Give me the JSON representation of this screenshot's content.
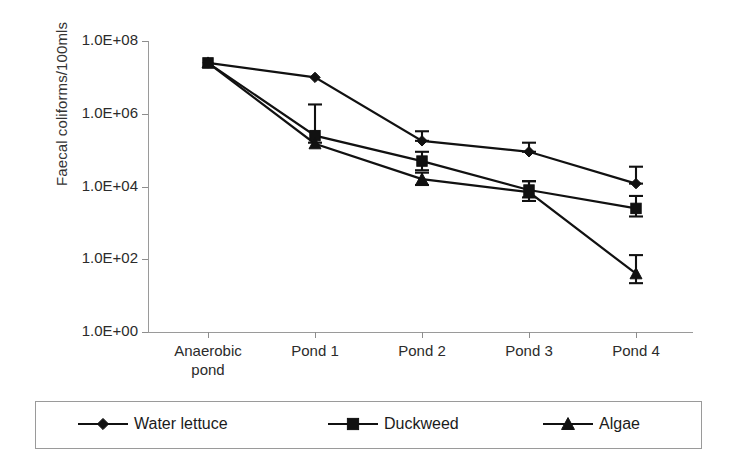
{
  "chart_data": {
    "type": "line",
    "title": "",
    "xlabel": "",
    "ylabel": "Faecal coliforms/100mls",
    "scale": "log",
    "grid": false,
    "legend_position": "bottom",
    "categories": [
      "Anaerobic pond",
      "Pond 1",
      "Pond 2",
      "Pond 3",
      "Pond 4"
    ],
    "ytick_labels": [
      "1.0E+08",
      "1.0E+06",
      "1.0E+04",
      "1.0E+02",
      "1.0E+00"
    ],
    "ytick_values": [
      100000000,
      1000000,
      10000,
      100,
      1
    ],
    "ylim": [
      1,
      100000000
    ],
    "series": [
      {
        "name": "Water lettuce",
        "marker": "diamond",
        "values": [
          25000000,
          10000000,
          180000,
          90000,
          12000
        ],
        "error_high": [
          25000000,
          10000000,
          330000,
          160000,
          35000
        ],
        "error_low": [
          25000000,
          10000000,
          180000,
          90000,
          12000
        ]
      },
      {
        "name": "Duckweed",
        "marker": "square",
        "values": [
          25000000,
          250000,
          50000,
          8000,
          2500
        ],
        "error_high": [
          25000000,
          1800000,
          90000,
          14000,
          5500
        ],
        "error_low": [
          25000000,
          160000,
          28000,
          5000,
          1500
        ]
      },
      {
        "name": "Algae",
        "marker": "triangle",
        "values": [
          25000000,
          150000,
          16000,
          7000,
          40
        ],
        "error_high": [
          25000000,
          150000,
          24000,
          14000,
          130
        ],
        "error_low": [
          25000000,
          150000,
          11000,
          4000,
          22
        ]
      }
    ]
  },
  "axes": {
    "y_title": "Faecal coliforms/100mls",
    "y_labels": [
      "1.0E+08",
      "1.0E+06",
      "1.0E+04",
      "1.0E+02",
      "1.0E+00"
    ],
    "x_labels": [
      "Anaerobic\npond",
      "Pond 1",
      "Pond 2",
      "Pond 3",
      "Pond 4"
    ]
  },
  "legend": {
    "entries": [
      {
        "label": "Water lettuce",
        "marker": "diamond"
      },
      {
        "label": "Duckweed",
        "marker": "square"
      },
      {
        "label": "Algae",
        "marker": "triangle"
      }
    ]
  },
  "colors": {
    "ink": "#111111",
    "axis": "#9a9a9a",
    "text": "#2b2b2b",
    "background": "#ffffff"
  }
}
